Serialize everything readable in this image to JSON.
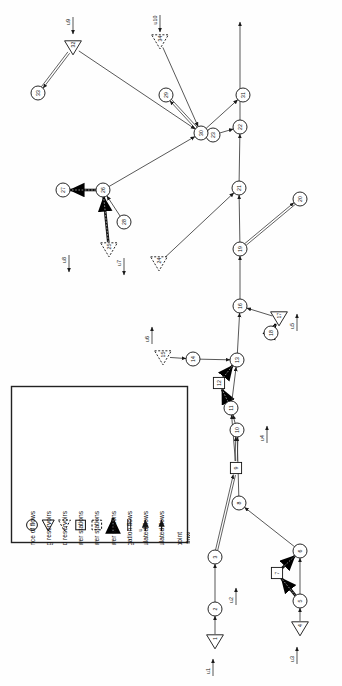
{
  "figure": {
    "orientation": "rotated-90-ccw",
    "background_color": "#fefefe",
    "line_color": "#3a3a3a",
    "heavy_line_color": "#111111"
  },
  "legend": {
    "box_border_color": "#222222",
    "entries": [
      {
        "symbol": "circle",
        "label": "Confluence of flows"
      },
      {
        "symbol": "triangle-down",
        "label": "Existing reservoirs"
      },
      {
        "symbol": "triangle-dashed",
        "label": "Proposed reservoirs"
      },
      {
        "symbol": "square",
        "label": "Existing power stations"
      },
      {
        "symbol": "square-dashed",
        "label": "Proposed power stations"
      },
      {
        "symbol": "double-arrow-heavy",
        "label": "Flows to and from power stations"
      },
      {
        "symbol": "double-line",
        "label": "Irrigation flows"
      },
      {
        "symbol": "arrow-u",
        "label": "Unregulated flows"
      },
      {
        "symbol": "arrow-plain",
        "label": "Regulated flows"
      }
    ],
    "note_line_1": "In all cases arrowheads point",
    "note_line_2": "in the direction of flow"
  },
  "nodes": [
    {
      "id": "1",
      "label": "1",
      "type": "triangle-down",
      "x": 215,
      "y": 641
    },
    {
      "id": "2",
      "label": "2",
      "type": "circle",
      "x": 215,
      "y": 609
    },
    {
      "id": "3",
      "label": "3",
      "type": "circle",
      "x": 215,
      "y": 557
    },
    {
      "id": "4",
      "label": "4",
      "type": "triangle-down",
      "x": 300,
      "y": 628
    },
    {
      "id": "5",
      "label": "5",
      "type": "circle",
      "x": 300,
      "y": 601
    },
    {
      "id": "6",
      "label": "6",
      "type": "circle",
      "x": 300,
      "y": 551
    },
    {
      "id": "7",
      "label": "7",
      "type": "square",
      "x": 277,
      "y": 573
    },
    {
      "id": "8",
      "label": "8",
      "type": "circle",
      "x": 239,
      "y": 503
    },
    {
      "id": "9",
      "label": "9",
      "type": "square",
      "x": 236,
      "y": 468
    },
    {
      "id": "10",
      "label": "10",
      "type": "circle",
      "x": 237,
      "y": 430
    },
    {
      "id": "11",
      "label": "11",
      "type": "circle",
      "x": 231,
      "y": 408
    },
    {
      "id": "12",
      "label": "12",
      "type": "square",
      "x": 219,
      "y": 383
    },
    {
      "id": "13",
      "label": "13",
      "type": "circle",
      "x": 237,
      "y": 360
    },
    {
      "id": "14",
      "label": "14",
      "type": "circle",
      "x": 193,
      "y": 359
    },
    {
      "id": "15",
      "label": "15",
      "type": "triangle-dashed",
      "x": 163,
      "y": 357
    },
    {
      "id": "16",
      "label": "16",
      "type": "circle",
      "x": 240,
      "y": 306
    },
    {
      "id": "17",
      "label": "17",
      "type": "triangle-down",
      "x": 279,
      "y": 318
    },
    {
      "id": "18",
      "label": "18",
      "type": "circle",
      "x": 271,
      "y": 333
    },
    {
      "id": "19",
      "label": "19",
      "type": "circle",
      "x": 240,
      "y": 249
    },
    {
      "id": "20",
      "label": "20",
      "type": "circle",
      "x": 300,
      "y": 199
    },
    {
      "id": "21",
      "label": "21",
      "type": "circle",
      "x": 239,
      "y": 188
    },
    {
      "id": "22",
      "label": "22",
      "type": "circle",
      "x": 240,
      "y": 127
    },
    {
      "id": "23",
      "label": "23",
      "type": "circle",
      "x": 213,
      "y": 135
    },
    {
      "id": "24",
      "label": "24",
      "type": "triangle-dashed",
      "x": 159,
      "y": 263
    },
    {
      "id": "25",
      "label": "25",
      "type": "triangle-dashed",
      "x": 109,
      "y": 249
    },
    {
      "id": "26",
      "label": "26",
      "type": "circle",
      "x": 103,
      "y": 190
    },
    {
      "id": "27",
      "label": "27",
      "type": "circle",
      "x": 63,
      "y": 190
    },
    {
      "id": "28",
      "label": "28",
      "type": "circle",
      "x": 124,
      "y": 222
    },
    {
      "id": "29",
      "label": "29",
      "type": "circle",
      "x": 166,
      "y": 95
    },
    {
      "id": "30",
      "label": "30",
      "type": "circle",
      "x": 201,
      "y": 133
    },
    {
      "id": "31",
      "label": "31",
      "type": "circle",
      "x": 243,
      "y": 95
    },
    {
      "id": "32",
      "label": "32",
      "type": "triangle-down",
      "x": 73,
      "y": 47
    },
    {
      "id": "33",
      "label": "33",
      "type": "circle",
      "x": 38,
      "y": 93
    },
    {
      "id": "34",
      "label": "34",
      "type": "triangle-dashed",
      "x": 160,
      "y": 41
    }
  ],
  "inflows": [
    {
      "label": "u1",
      "x": 213,
      "y": 676
    },
    {
      "label": "u2",
      "x": 236,
      "y": 605
    },
    {
      "label": "u3",
      "x": 297,
      "y": 664
    },
    {
      "label": "u4",
      "x": 267,
      "y": 443
    },
    {
      "label": "u5",
      "x": 297,
      "y": 331
    },
    {
      "label": "u6",
      "x": 152,
      "y": 344
    },
    {
      "label": "u7",
      "x": 124,
      "y": 258
    },
    {
      "label": "u8",
      "x": 69,
      "y": 255
    },
    {
      "label": "u9",
      "x": 73,
      "y": 17
    },
    {
      "label": "u10",
      "x": 160,
      "y": 15
    }
  ],
  "edges": [
    {
      "from": "1",
      "to": "2",
      "style": "plain"
    },
    {
      "from": "2",
      "to": "3",
      "style": "plain"
    },
    {
      "from": "4",
      "to": "5",
      "style": "plain"
    },
    {
      "from": "5",
      "to": "7",
      "style": "heavy"
    },
    {
      "from": "7",
      "to": "6",
      "style": "heavy"
    },
    {
      "from": "5",
      "to": "6",
      "style": "plain"
    },
    {
      "from": "6",
      "to": "8",
      "style": "plain"
    },
    {
      "from": "3",
      "to": "9",
      "style": "double"
    },
    {
      "from": "9",
      "to": "10",
      "style": "double"
    },
    {
      "from": "8",
      "to": "10",
      "style": "plain"
    },
    {
      "from": "9",
      "to": "11",
      "style": "plain"
    },
    {
      "from": "10",
      "to": "11",
      "style": "plain"
    },
    {
      "from": "11",
      "to": "12",
      "style": "heavy"
    },
    {
      "from": "12",
      "to": "13",
      "style": "heavy"
    },
    {
      "from": "11",
      "to": "13",
      "style": "plain"
    },
    {
      "from": "14",
      "to": "13",
      "style": "plain"
    },
    {
      "from": "15",
      "to": "14",
      "style": "plain"
    },
    {
      "from": "13",
      "to": "16",
      "style": "plain"
    },
    {
      "from": "17",
      "to": "16",
      "style": "plain"
    },
    {
      "from": "18",
      "to": "17",
      "style": "heavy"
    },
    {
      "from": "16",
      "to": "19",
      "style": "plain"
    },
    {
      "from": "19",
      "to": "20",
      "style": "double"
    },
    {
      "from": "19",
      "to": "21",
      "style": "plain"
    },
    {
      "from": "21",
      "to": "22",
      "style": "plain"
    },
    {
      "from": "23",
      "to": "22",
      "style": "plain"
    },
    {
      "from": "24",
      "to": "21",
      "style": "plain"
    },
    {
      "from": "25",
      "to": "26",
      "style": "heavy"
    },
    {
      "from": "26",
      "to": "27",
      "style": "heavy"
    },
    {
      "from": "28",
      "to": "26",
      "style": "plain"
    },
    {
      "from": "26",
      "to": "30",
      "style": "plain"
    },
    {
      "from": "30",
      "to": "29",
      "style": "double"
    },
    {
      "from": "30",
      "to": "31",
      "style": "plain"
    },
    {
      "from": "32",
      "to": "33",
      "style": "double"
    },
    {
      "from": "32",
      "to": "30",
      "style": "plain"
    },
    {
      "from": "34",
      "to": "30",
      "style": "plain"
    },
    {
      "from": "22",
      "to": "top",
      "style": "plain"
    }
  ]
}
